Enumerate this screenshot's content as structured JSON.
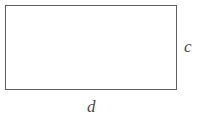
{
  "figure": {
    "type": "rectangle-diagram",
    "background_color": "#ffffff",
    "stroke_color": "#5f5f5f",
    "stroke_width_px": 1,
    "label_color": "#4a4a4a",
    "shape": {
      "name": "rectangle",
      "x": 5,
      "y": 5,
      "width": 172,
      "height": 85,
      "fill": "#ffffff"
    },
    "labels": {
      "right_side": "c",
      "bottom_side": "d"
    }
  }
}
